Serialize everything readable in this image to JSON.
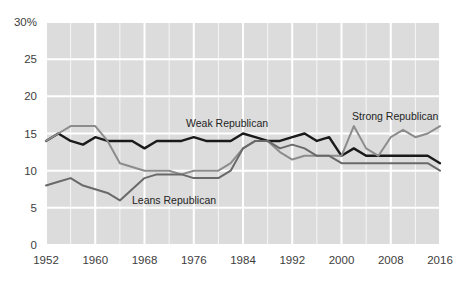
{
  "chart_data": {
    "type": "line",
    "title": "",
    "subtitle": "",
    "xlabel": "",
    "ylabel": "",
    "xlim": [
      1952,
      2016
    ],
    "ylim": [
      0,
      30
    ],
    "yticks": [
      0,
      5,
      10,
      15,
      20,
      25,
      30
    ],
    "ytick_labels": [
      "0",
      "5",
      "10",
      "15",
      "20",
      "25",
      "30%"
    ],
    "xticks": [
      1952,
      1960,
      1968,
      1976,
      1984,
      1992,
      2000,
      2008,
      2016
    ],
    "xtick_labels": [
      "1952",
      "1960",
      "1968",
      "1976",
      "1984",
      "1992",
      "2000",
      "2008",
      "2016"
    ],
    "grid": true,
    "grid_color": "#ffffff",
    "plot_background": "#dcdcdc",
    "legend_position": "inline-annotations",
    "x": [
      1952,
      1954,
      1956,
      1958,
      1960,
      1962,
      1964,
      1966,
      1968,
      1970,
      1972,
      1974,
      1976,
      1978,
      1980,
      1982,
      1984,
      1986,
      1988,
      1990,
      1992,
      1994,
      1996,
      1998,
      2000,
      2002,
      2004,
      2006,
      2008,
      2010,
      2012,
      2014,
      2016
    ],
    "series": [
      {
        "name": "Weak Republican",
        "color": "#1a1a1a",
        "values": [
          14,
          15,
          14,
          13.5,
          14.5,
          14,
          14,
          14,
          13,
          14,
          14,
          14,
          14.5,
          14,
          14,
          14,
          15,
          14.5,
          14,
          14,
          14.5,
          15,
          14,
          14.5,
          12,
          13,
          12,
          12,
          12,
          12,
          12,
          12,
          11
        ]
      },
      {
        "name": "Strong Republican",
        "color": "#8c8c8c",
        "values": [
          14,
          15,
          16,
          16,
          16,
          14,
          11,
          10.5,
          10,
          10,
          10,
          9.5,
          10,
          10,
          10,
          11,
          13,
          14,
          14,
          12.5,
          11.5,
          12,
          12,
          12,
          12,
          16,
          13,
          12,
          14.5,
          15.5,
          14.5,
          15,
          16
        ]
      },
      {
        "name": "Leans Republican",
        "color": "#696969",
        "values": [
          8,
          8.5,
          9,
          8,
          7.5,
          7,
          6,
          7.5,
          9,
          9.5,
          9.5,
          9.5,
          9,
          9,
          9,
          10,
          13,
          14,
          14,
          13,
          13.5,
          13,
          12,
          12,
          11,
          11,
          11,
          11,
          11,
          11,
          11,
          11,
          10
        ]
      }
    ],
    "annotations": [
      {
        "text": "Weak Republican",
        "x_px": 186,
        "y_px": 127
      },
      {
        "text": "Strong Republican",
        "x_px": 352,
        "y_px": 120
      },
      {
        "text": "Leans Republican",
        "x_px": 132,
        "y_px": 204
      }
    ]
  }
}
